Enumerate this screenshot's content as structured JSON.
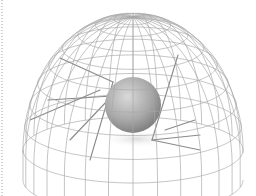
{
  "scene": {
    "description": "Wireframe hemisphere dome with a shaded gray sphere at its center and straight rays inside",
    "colors": {
      "background": "#ffffff",
      "wire": "#a8a8a8",
      "ray": "#8a8a8a",
      "sphere_light": "#d6d6d6",
      "sphere_mid": "#b0b0b0",
      "sphere_dark": "#7e7e7e",
      "shadow": "#e6e6e6",
      "border_dots": "#cfcfcf"
    },
    "dome": {
      "cx": 133,
      "base_cy": 150,
      "rx": 110,
      "ry": 33,
      "top_y": 17,
      "base_height": 30
    },
    "sphere": {
      "cx": 133,
      "cy": 105,
      "r": 28
    },
    "rays": [
      {
        "x1": 60,
        "y1": 58,
        "x2": 113,
        "y2": 82
      },
      {
        "x1": 178,
        "y1": 55,
        "x2": 152,
        "y2": 140
      },
      {
        "x1": 152,
        "y1": 140,
        "x2": 200,
        "y2": 135
      },
      {
        "x1": 152,
        "y1": 140,
        "x2": 200,
        "y2": 150
      },
      {
        "x1": 113,
        "y1": 82,
        "x2": 90,
        "y2": 160
      },
      {
        "x1": 108,
        "y1": 100,
        "x2": 70,
        "y2": 140
      },
      {
        "x1": 48,
        "y1": 100,
        "x2": 112,
        "y2": 96
      },
      {
        "x1": 30,
        "y1": 120,
        "x2": 100,
        "y2": 90
      },
      {
        "x1": 165,
        "y1": 130,
        "x2": 195,
        "y2": 120
      }
    ]
  }
}
